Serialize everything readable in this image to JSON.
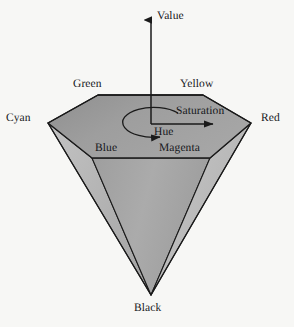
{
  "figure": {
    "background_color": "#f7f7f5",
    "line_color": "#1a1a1a",
    "axis": {
      "name": "value-axis",
      "label": "Value",
      "direction": "up"
    },
    "labels": {
      "value": "Value",
      "green": "Green",
      "yellow": "Yellow",
      "cyan": "Cyan",
      "red": "Red",
      "blue": "Blue",
      "magenta": "Magenta",
      "black": "Black",
      "hue": "Hue",
      "saturation": "Saturation"
    },
    "faces": {
      "top_hexagon_color": "#9c9c9c",
      "left_cone_color": "#b4b4b4",
      "center_cone_color": "#a6a6a6",
      "right_cone_color": "#b9b9b9"
    },
    "vertices": {
      "green": {
        "x": 98,
        "y": 95
      },
      "yellow": {
        "x": 203,
        "y": 95
      },
      "red": {
        "x": 251,
        "y": 123
      },
      "magenta": {
        "x": 210,
        "y": 158
      },
      "blue": {
        "x": 92,
        "y": 158
      },
      "cyan": {
        "x": 48,
        "y": 123
      },
      "black": {
        "x": 151,
        "y": 295
      },
      "center": {
        "x": 151,
        "y": 124
      }
    },
    "annotations": {
      "hue_arc": "circular arrow around the value axis indicating hue angle",
      "saturation_arrow": "horizontal arrow from the axis toward the Red vertex",
      "value_arrow": "vertical arrow pointing up from the hexagon center"
    }
  }
}
